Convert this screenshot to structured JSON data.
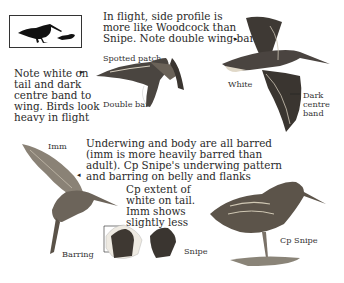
{
  "page": {
    "size_icon": "size-comparison-silhouette-icon"
  },
  "annotations": {
    "flight_profile": "In flight, side profile is\nmore like Woodcock than\nSnipe. Note double wing-bar",
    "tail_note": "Note white on\ntail and dark\ncentre band to\nwing. Birds look\nheavy in flight",
    "spotted_patch": "Spotted patch",
    "double_bar": "Double bar",
    "white": "White",
    "dark_centre_band": "Dark\ncentre\nband",
    "imm": "Imm",
    "underwing": "Underwing and body are all barred\n(imm is more heavily barred than\nadult). Cp Snipe's underwing pattern\nand barring on belly and flanks",
    "tail_extent": "Cp extent of\nwhite on tail.\nImm shows\nslightly less",
    "barring": "Barring",
    "snipe_tail": "Snipe",
    "cp_snipe": "Cp Snipe"
  },
  "icons": {
    "arrow_right": "▸",
    "arrow_left": "◂"
  },
  "colors": {
    "ink": "#2a2a2a",
    "bird_dark": "#3a3530",
    "bird_mid": "#7a7064",
    "bird_light": "#c8c0b0"
  }
}
